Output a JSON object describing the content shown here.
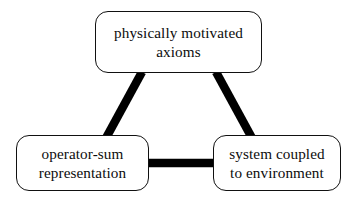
{
  "diagram": {
    "background_color": "#ffffff",
    "edge_color": "#000000",
    "node_border_color": "#111111",
    "node_fill_color": "#ffffff",
    "nodes": [
      {
        "id": "axioms",
        "line1": "physically motivated",
        "line2": "axioms"
      },
      {
        "id": "opsum",
        "line1": "operator-sum",
        "line2": "representation"
      },
      {
        "id": "system",
        "line1": "system coupled",
        "line2": "to environment"
      }
    ],
    "edges": [
      {
        "id": "axioms-opsum",
        "from": "axioms",
        "to": "opsum"
      },
      {
        "id": "axioms-system",
        "from": "axioms",
        "to": "system"
      },
      {
        "id": "opsum-system",
        "from": "opsum",
        "to": "system"
      }
    ]
  }
}
